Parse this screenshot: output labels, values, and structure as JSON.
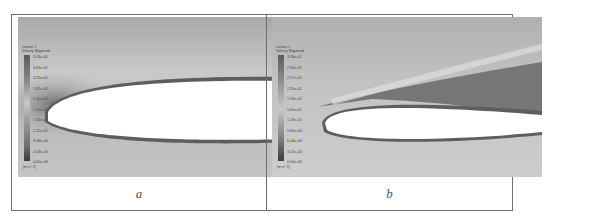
{
  "figure": {
    "panels": [
      {
        "id": "a",
        "caption": "a",
        "legend": {
          "title_line1": "contour-1",
          "title_line2": "Velocity Magnitude",
          "ticks": [
            "4.03e+01",
            "3.63e+01",
            "3.22e+01",
            "2.82e+01",
            "2.42e+01",
            "2.01e+01",
            "1.61e+01",
            "1.21e+01",
            "8.06e+00",
            "4.03e+00",
            "0.00e+00"
          ],
          "units": "[m s^-1]"
        },
        "description": "Velocity magnitude contour around airfoil leading edge, near-zero incidence"
      },
      {
        "id": "b",
        "caption": "b",
        "legend": {
          "title_line1": "contour-1",
          "title_line2": "Velocity Magnitude",
          "ticks": [
            "3.20e+01",
            "2.90e+01",
            "2.57e+01",
            "2.25e+01",
            "1.93e+01",
            "1.61e+01",
            "1.29e+01",
            "9.65e+00",
            "6.44e+00",
            "3.22e+00",
            "0.00e+00"
          ],
          "units": "[m s^-1]"
        },
        "description": "Velocity magnitude contour around airfoil at incidence with separated wake above suction side"
      }
    ],
    "colors": {
      "frame": "#6e6e6e",
      "airfoil": "#ffffff",
      "field_light": "#d4d4d4",
      "field_dark": "#7a7a7a"
    }
  }
}
